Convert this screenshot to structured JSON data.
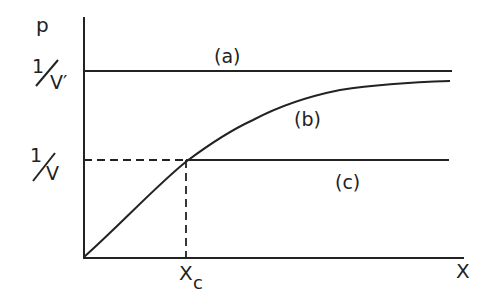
{
  "diagram": {
    "y_axis_label": "p",
    "x_axis_label": "X",
    "y_tick_top": {
      "numerator": "1",
      "denominator": "V′"
    },
    "y_tick_mid": {
      "numerator": "1",
      "denominator": "V"
    },
    "x_tick": {
      "main": "X",
      "sub": "c"
    },
    "curves": [
      {
        "id": "a",
        "label": "(a)",
        "description": "horizontal line at p = 1/V′"
      },
      {
        "id": "b",
        "label": "(b)",
        "description": "increasing concave curve approaching 1/V′"
      },
      {
        "id": "c",
        "label": "(c)",
        "description": "horizontal line at p = 1/V starting at Xc"
      }
    ],
    "colors": {
      "line": "#222222",
      "background": "#ffffff"
    }
  }
}
